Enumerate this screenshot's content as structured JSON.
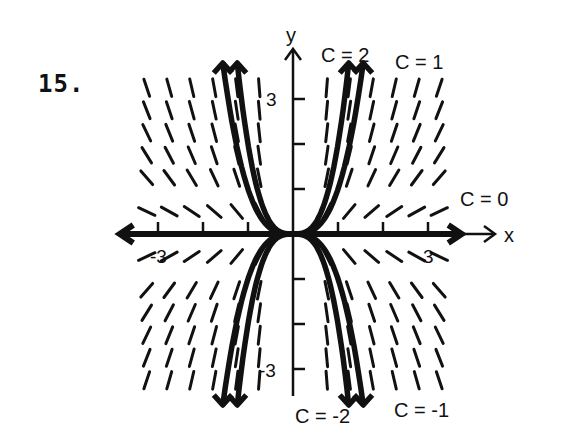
{
  "problem": {
    "number": "15."
  },
  "axes": {
    "x_label": "x",
    "y_label": "y",
    "x_tick_labels": {
      "neg": "-3",
      "pos": "3"
    },
    "y_tick_labels": {
      "pos": "3",
      "neg": "-3"
    }
  },
  "curve_labels": [
    {
      "text": "C = 2",
      "c": 2
    },
    {
      "text": "C = 1",
      "c": 1
    },
    {
      "text": "C = 0",
      "c": 0
    },
    {
      "text": "C = -2",
      "c": -2
    },
    {
      "text": "C = -1",
      "c": -1
    }
  ],
  "chart_data": {
    "type": "line",
    "title": "15.",
    "xlabel": "x",
    "ylabel": "y",
    "xlim": [
      -4.2,
      4.5
    ],
    "ylim": [
      -3.6,
      4.1
    ],
    "x_ticks": [
      -3,
      -2,
      -1,
      1,
      2,
      3
    ],
    "y_ticks": [
      -3,
      -2,
      -1,
      1,
      2,
      3
    ],
    "tick_labels": {
      "x": [
        "-3",
        "3"
      ],
      "y": [
        "3",
        "-3"
      ]
    },
    "grid": false,
    "slope_field": {
      "x_values": [
        -3.25,
        -2.75,
        -2.25,
        -1.75,
        -1.25,
        -0.75,
        0.75,
        1.25,
        1.75,
        2.25,
        2.75,
        3.25
      ],
      "y_values": [
        3.25,
        2.75,
        2.25,
        1.75,
        1.25,
        0.5,
        -0.5,
        -1.25,
        -1.75,
        -2.25,
        -2.75,
        -3.25
      ],
      "slope_rule": "dy/dx = 3y/x"
    },
    "series": [
      {
        "name": "C = 2",
        "c": 2,
        "equation": "y = 2x^3"
      },
      {
        "name": "C = 1",
        "c": 1,
        "equation": "y = x^3"
      },
      {
        "name": "C = 0",
        "c": 0,
        "equation": "y = 0"
      },
      {
        "name": "C = -1",
        "c": -1,
        "equation": "y = -x^3"
      },
      {
        "name": "C = -2",
        "c": -2,
        "equation": "y = -2x^3"
      }
    ]
  }
}
